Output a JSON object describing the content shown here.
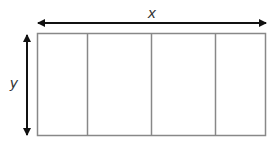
{
  "diagram": {
    "type": "rectangle-dimensions",
    "labels": {
      "width": "x",
      "height": "y"
    },
    "rectangle": {
      "sections": 4,
      "stroke_color": "#888888"
    },
    "arrow_color": "#111111"
  }
}
